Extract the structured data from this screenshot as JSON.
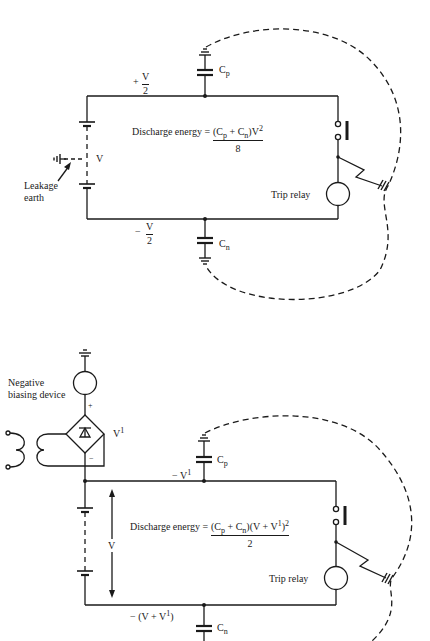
{
  "figure": {
    "type": "circuit-diagram",
    "colors": {
      "line": "#1a1a1a",
      "background": "#ffffff"
    },
    "top_circuit": {
      "equation": {
        "lhs": "Discharge energy =",
        "numerator_cp": "(C",
        "numerator_cp_sub": "p",
        "numerator_plus": " + C",
        "numerator_cn_sub": "n",
        "numerator_rest": ")V",
        "numerator_sup": "2",
        "denominator": "8"
      },
      "positive_rail": {
        "sign": "+",
        "num": "V",
        "den": "2"
      },
      "negative_rail": {
        "sign": "−",
        "num": "V",
        "den": "2"
      },
      "battery_label": "V",
      "leakage_label_line1": "Leakage",
      "leakage_label_line2": "earth",
      "cp_label": "C",
      "cp_sub": "p",
      "cn_label": "C",
      "cn_sub": "n",
      "trip_relay_label": "Trip relay"
    },
    "bottom_circuit": {
      "equation": {
        "lhs": "Discharge energy =",
        "numerator_cp": "(C",
        "numerator_cp_sub": "p",
        "numerator_plus": " + C",
        "numerator_cn_sub": "n",
        "numerator_rest": ")(V + V",
        "numerator_sup1": "1",
        "numerator_close": ")",
        "numerator_sup2": "2",
        "denominator": "2"
      },
      "biasing_label_line1": "Negative",
      "biasing_label_line2": "biasing device",
      "plus_sign": "+",
      "minus_sign": "−",
      "v1_label": "V",
      "v1_sup": "1",
      "top_rail_label": "− V",
      "top_rail_sup": "1",
      "bottom_rail_label": "− (V + V",
      "bottom_rail_sup": "1",
      "bottom_rail_close": ")",
      "battery_label": "V",
      "cp_label": "C",
      "cp_sub": "p",
      "cn_label": "C",
      "cn_sub": "n",
      "trip_relay_label": "Trip relay"
    }
  }
}
